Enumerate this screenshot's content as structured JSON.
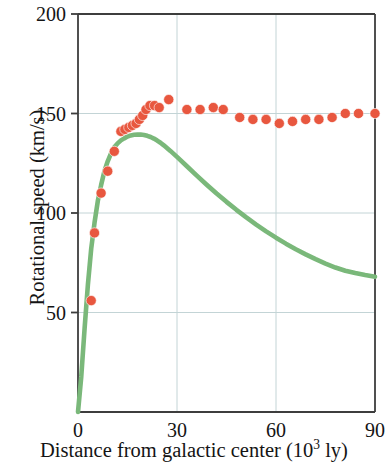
{
  "chart_data": {
    "type": "scatter",
    "title": "",
    "xlabel": "Distance from galactic center (10^3 ly)",
    "ylabel": "Rotational speed (km/s)",
    "xlim": [
      0,
      90
    ],
    "ylim": [
      0,
      200
    ],
    "xticks": [
      0,
      30,
      60,
      90
    ],
    "yticks": [
      50,
      100,
      150,
      200
    ],
    "grid": true,
    "gridlines_x": [
      30,
      60
    ],
    "gridlines_y": [
      50,
      100,
      150,
      200
    ],
    "legend": "none",
    "series": [
      {
        "name": "Observed rotational speed",
        "type": "scatter",
        "color": "#e8573f",
        "marker": "circle",
        "points": [
          [
            4,
            56
          ],
          [
            5,
            90
          ],
          [
            7,
            110
          ],
          [
            9,
            121
          ],
          [
            11,
            131
          ],
          [
            13,
            141
          ],
          [
            14.2,
            142
          ],
          [
            15.4,
            143
          ],
          [
            16.5,
            144
          ],
          [
            17.6,
            145
          ],
          [
            18.6,
            147
          ],
          [
            19.6,
            149
          ],
          [
            20.6,
            152
          ],
          [
            21.8,
            154
          ],
          [
            23.2,
            154
          ],
          [
            24.6,
            153
          ],
          [
            27.5,
            157
          ],
          [
            33,
            152
          ],
          [
            37,
            152
          ],
          [
            41,
            153
          ],
          [
            44,
            152
          ],
          [
            49,
            148
          ],
          [
            53,
            147
          ],
          [
            57,
            147
          ],
          [
            61,
            145
          ],
          [
            65,
            146
          ],
          [
            69,
            147
          ],
          [
            73,
            147
          ],
          [
            77,
            148
          ],
          [
            81,
            150
          ],
          [
            85,
            150
          ],
          [
            90,
            150
          ]
        ]
      },
      {
        "name": "Predicted rotational speed from visible matter",
        "type": "line",
        "color": "#7ab87a",
        "points": [
          [
            0,
            0
          ],
          [
            1,
            18
          ],
          [
            2,
            42
          ],
          [
            3,
            64
          ],
          [
            4,
            82
          ],
          [
            5,
            95
          ],
          [
            6,
            106
          ],
          [
            7,
            114
          ],
          [
            8,
            121
          ],
          [
            9,
            126
          ],
          [
            10,
            130
          ],
          [
            11,
            133
          ],
          [
            12,
            135
          ],
          [
            13,
            136.5
          ],
          [
            14,
            137.5
          ],
          [
            15,
            138.4
          ],
          [
            16,
            139
          ],
          [
            17,
            139.3
          ],
          [
            18,
            139.4
          ],
          [
            19,
            139.4
          ],
          [
            20,
            139.2
          ],
          [
            21,
            138.8
          ],
          [
            22,
            138.2
          ],
          [
            23,
            137.4
          ],
          [
            24,
            136.4
          ],
          [
            25,
            135.3
          ],
          [
            26,
            134
          ],
          [
            28,
            131.2
          ],
          [
            30,
            128.2
          ],
          [
            33,
            123.5
          ],
          [
            36,
            118.8
          ],
          [
            39,
            114.2
          ],
          [
            42,
            109.8
          ],
          [
            45,
            105.6
          ],
          [
            48,
            101.6
          ],
          [
            51,
            97.8
          ],
          [
            54,
            94.2
          ],
          [
            57,
            90.8
          ],
          [
            60,
            87.6
          ],
          [
            63,
            84.6
          ],
          [
            66,
            81.8
          ],
          [
            69,
            79.2
          ],
          [
            72,
            76.8
          ],
          [
            75,
            74.6
          ],
          [
            78,
            72.6
          ],
          [
            81,
            71
          ],
          [
            84,
            69.8
          ],
          [
            87,
            68.8
          ],
          [
            90,
            68
          ]
        ]
      }
    ]
  },
  "axis": {
    "x_tick_labels": [
      "0",
      "30",
      "60",
      "90"
    ],
    "y_tick_labels": [
      "50",
      "100",
      "150",
      "200"
    ],
    "x_title_main": "Distance from galactic center (10",
    "x_title_exponent": "3",
    "x_title_tail": " ly)",
    "y_title": "Rotational speed (km/s)"
  },
  "style": {
    "marker_color": "#e8573f",
    "line_color": "#7ab87a",
    "grid_color": "#c3d4d6",
    "frame_color": "#3d3d3d",
    "background": "#ffffff"
  }
}
